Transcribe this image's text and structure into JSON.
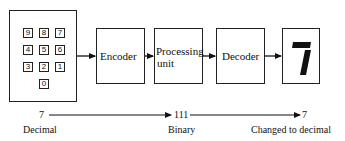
{
  "diagram": {
    "keypad": {
      "keys": [
        [
          "9",
          "8",
          "7"
        ],
        [
          "4",
          "5",
          "6"
        ],
        [
          "3",
          "2",
          "1"
        ],
        [
          "0"
        ]
      ]
    },
    "blocks": {
      "encoder": "Encoder",
      "processing_line1": "Processing",
      "processing_line2": "unit",
      "decoder": "Decoder"
    },
    "display": {
      "digit": "7"
    },
    "bottom_row": {
      "input_value": "7",
      "input_label": "Decimal",
      "middle_value": "111",
      "middle_label": "Binary",
      "output_value": "7",
      "output_label": "Changed to decimal"
    }
  }
}
